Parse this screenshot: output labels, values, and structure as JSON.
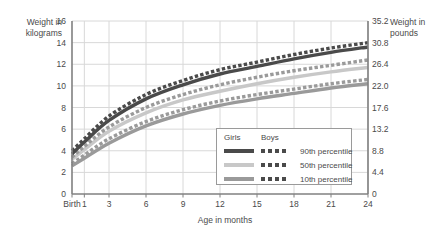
{
  "axes": {
    "y_left_title": "Weight in\nkilograms",
    "y_right_title": "Weight in\npounds",
    "x_title": "Age in months"
  },
  "legend": {
    "header_girls": "Girls",
    "header_boys": "Boys",
    "rows": [
      {
        "label": "90th percentile",
        "girls_color": "#4a4a4a",
        "boys_color": "#4a4a4a"
      },
      {
        "label": "50th percentile",
        "girls_color": "#c8c8c8",
        "boys_color": "#4a4a4a"
      },
      {
        "label": "10th percentile",
        "girls_color": "#9a9a9a",
        "boys_color": "#4a4a4a"
      }
    ]
  },
  "colors": {
    "dark": "#4a4a4a",
    "medium": "#9a9a9a",
    "light": "#c8c8c8",
    "grid": "#d8d8d8",
    "axis": "#808080"
  },
  "chart_data": {
    "type": "line",
    "title": "",
    "xlabel": "Age in months",
    "ylabel": "Weight in kilograms",
    "y2label": "Weight in pounds",
    "grid": true,
    "legend_position": "inside-bottom-right",
    "x": [
      0,
      1,
      3,
      6,
      9,
      12,
      15,
      18,
      21,
      24
    ],
    "xtick_labels": [
      "Birth",
      "1",
      "3",
      "6",
      "9",
      "12",
      "15",
      "18",
      "21",
      "24"
    ],
    "xlim": [
      0,
      24
    ],
    "ylim": [
      0,
      16
    ],
    "ytick_values": [
      0,
      2,
      4,
      6,
      8,
      10,
      12,
      14,
      16
    ],
    "ytick_labels": [
      "0",
      "2",
      "4",
      "6",
      "8",
      "10",
      "12",
      "14",
      "16"
    ],
    "y2tick_labels": [
      "0",
      "4.4",
      "8.8",
      "13.2",
      "17.6",
      "22.0",
      "26.4",
      "30.8",
      "35.2"
    ],
    "y2lim": [
      0,
      35.2
    ],
    "series": [
      {
        "name": "Boys 90th percentile",
        "sex": "Boys",
        "percentile": "90th",
        "style": "dashed",
        "color": "#4a4a4a",
        "values": [
          4.0,
          5.1,
          7.2,
          9.2,
          10.5,
          11.5,
          12.2,
          12.9,
          13.5,
          14.0
        ]
      },
      {
        "name": "Girls 90th percentile",
        "sex": "Girls",
        "percentile": "90th",
        "style": "solid",
        "color": "#4a4a4a",
        "values": [
          3.7,
          4.8,
          6.8,
          8.8,
          10.1,
          11.1,
          11.8,
          12.5,
          13.1,
          13.6
        ]
      },
      {
        "name": "Boys 50th percentile",
        "sex": "Boys",
        "percentile": "50th",
        "style": "dashed",
        "color": "#9a9a9a",
        "values": [
          3.4,
          4.4,
          6.2,
          8.0,
          9.2,
          10.1,
          10.8,
          11.4,
          11.9,
          12.4
        ]
      },
      {
        "name": "Girls 50th percentile",
        "sex": "Girls",
        "percentile": "50th",
        "style": "solid",
        "color": "#c8c8c8",
        "values": [
          3.2,
          4.1,
          5.8,
          7.5,
          8.7,
          9.5,
          10.2,
          10.8,
          11.3,
          11.7
        ]
      },
      {
        "name": "Boys 10th percentile",
        "sex": "Boys",
        "percentile": "10th",
        "style": "dashed",
        "color": "#9a9a9a",
        "values": [
          2.8,
          3.6,
          5.1,
          6.7,
          7.8,
          8.6,
          9.2,
          9.7,
          10.2,
          10.6
        ]
      },
      {
        "name": "Girls 10th percentile",
        "sex": "Girls",
        "percentile": "10th",
        "style": "solid",
        "color": "#9a9a9a",
        "values": [
          2.6,
          3.3,
          4.7,
          6.3,
          7.4,
          8.2,
          8.8,
          9.3,
          9.8,
          10.2
        ]
      }
    ]
  }
}
